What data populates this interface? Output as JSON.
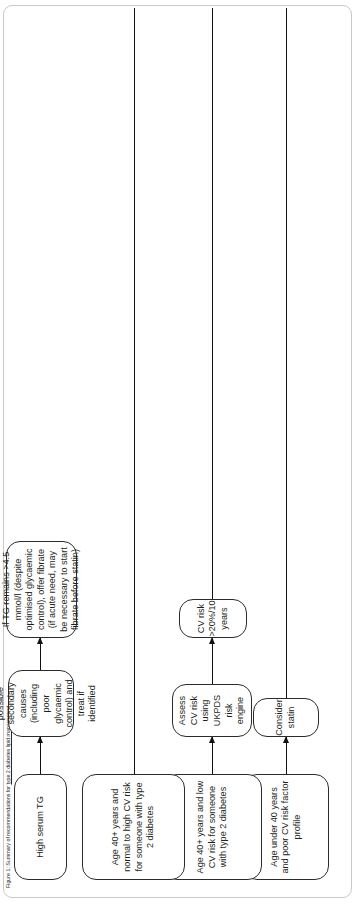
{
  "figure": {
    "caption_prefix": "Figure 1: Summary of recommendations for ",
    "caption_link": "type 2 diabetes lipid management",
    "caption_full": "Figure 1: Summary of recommendations for type 2 diabetes lipid management"
  },
  "colors": {
    "node_border": "#2b2b2b",
    "node_fill": "#ffffff",
    "arrow": "#111111",
    "card_border": "#c9c9c9",
    "text": "#231f20"
  },
  "flow": {
    "rows": [
      {
        "id": "row-under-40",
        "nodes": [
          {
            "id": "age-under-40",
            "label": "Age under 40 years and poor CV risk factor profile"
          },
          {
            "id": "consider-statin",
            "label": "Consider statin"
          }
        ]
      },
      {
        "id": "row-40-plus-low-risk",
        "nodes": [
          {
            "id": "age-40-plus-low-risk",
            "label": "Age 40+ years and low CV risk for someone with type 2 diabetes"
          },
          {
            "id": "assess-cv-risk-ukpds",
            "label": "Assess CV risk using UKPDS risk engine"
          },
          {
            "id": "cv-risk-over-20",
            "label": "CV risk >20%/10 years"
          }
        ]
      },
      {
        "id": "row-40-plus-normal-high-risk",
        "nodes": [
          {
            "id": "age-40-plus-normal-high-risk",
            "label": "Age 40+ years and normal to high CV risk for someone with type 2 diabetes"
          }
        ]
      },
      {
        "id": "row-high-tg",
        "nodes": [
          {
            "id": "high-serum-tg",
            "label": "High serum TG"
          },
          {
            "id": "assess-secondary-causes",
            "label": "Assess possible secondary causes (including poor glycaemic control) and treat if identified"
          },
          {
            "id": "tg-remains-fibrate",
            "label": "If TG remains >4.5 mmol/l (despite optimised glycaemic control), offer fibrate (if acute need, may be necessary to start fibrate before statin)"
          }
        ]
      }
    ]
  }
}
